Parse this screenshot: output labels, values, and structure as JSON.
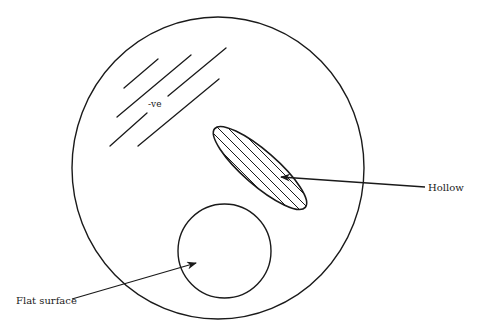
{
  "diagram": {
    "labels": {
      "negative": "-ve",
      "hollow": "Hollow",
      "flat_surface": "Flat surface"
    },
    "colors": {
      "stroke": "#1a1a1a",
      "background": "#ffffff"
    },
    "shapes": {
      "outer_circle": {
        "cx": 218,
        "cy": 168,
        "rx": 146,
        "ry": 151
      },
      "hollow_ellipse": {
        "cx": 260,
        "cy": 168,
        "rx": 60,
        "ry": 17,
        "rotation_deg": 41
      },
      "flat_circle": {
        "cx": 224.5,
        "cy": 251,
        "rx": 46.5,
        "ry": 47
      },
      "negative_lines": [
        [
          124,
          88,
          158,
          59
        ],
        [
          117,
          117,
          191,
          55
        ],
        [
          168,
          96,
          226,
          48
        ],
        [
          110,
          146,
          147,
          113
        ],
        [
          138,
          146,
          219,
          79
        ]
      ]
    }
  }
}
